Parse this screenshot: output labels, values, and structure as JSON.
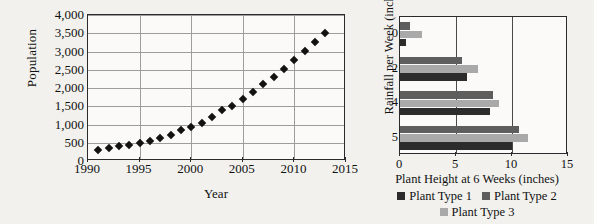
{
  "chart_data": [
    {
      "id": "population-scatter",
      "type": "scatter",
      "title": "",
      "xlabel": "Year",
      "ylabel": "Population",
      "xlim": [
        1990,
        2015
      ],
      "ylim": [
        0,
        4000
      ],
      "xticks": [
        "1990",
        "1995",
        "2000",
        "2005",
        "2010",
        "2015"
      ],
      "xtick_values": [
        1990,
        1995,
        2000,
        2005,
        2010,
        2015
      ],
      "yticks": [
        "0",
        "500",
        "1,000",
        "1,500",
        "2,000",
        "2,500",
        "3,000",
        "3,500",
        "4,000"
      ],
      "ytick_values": [
        0,
        500,
        1000,
        1500,
        2000,
        2500,
        3000,
        3500,
        4000
      ],
      "grid": "horizontal-and-vertical",
      "marker": "filled-diamond",
      "marker_color": "#121212",
      "x": [
        1991,
        1992,
        1993,
        1994,
        1995,
        1996,
        1997,
        1998,
        1999,
        2000,
        2001,
        2002,
        2003,
        2004,
        2005,
        2006,
        2007,
        2008,
        2009,
        2010,
        2011,
        2012,
        2013
      ],
      "y": [
        310,
        360,
        400,
        440,
        490,
        560,
        640,
        710,
        840,
        940,
        1050,
        1200,
        1390,
        1520,
        1690,
        1880,
        2100,
        2310,
        2530,
        2760,
        3010,
        3250,
        3500
      ]
    },
    {
      "id": "plant-height-bar",
      "type": "bar",
      "orientation": "horizontal",
      "title": "",
      "xlabel": "Plant Height at 6 Weeks (inches)",
      "ylabel": "Rainfall per Week (inches)",
      "categories": [
        "0",
        "2",
        "4",
        "5"
      ],
      "xlim": [
        0,
        15
      ],
      "xticks": [
        "0",
        "5",
        "10",
        "15"
      ],
      "xtick_values": [
        0,
        5,
        10,
        15
      ],
      "grid": "vertical",
      "legend_position": "bottom",
      "series": [
        {
          "name": "Plant Type 1",
          "color": "#2c2c2c",
          "values": [
            0.5,
            6.0,
            8.0,
            10.0
          ]
        },
        {
          "name": "Plant Type 2",
          "color": "#5e5e5e",
          "values": [
            0.9,
            5.5,
            8.3,
            10.6
          ]
        },
        {
          "name": "Plant Type 3",
          "color": "#a9a9a9",
          "values": [
            2.0,
            7.0,
            8.8,
            11.4
          ]
        }
      ]
    }
  ]
}
